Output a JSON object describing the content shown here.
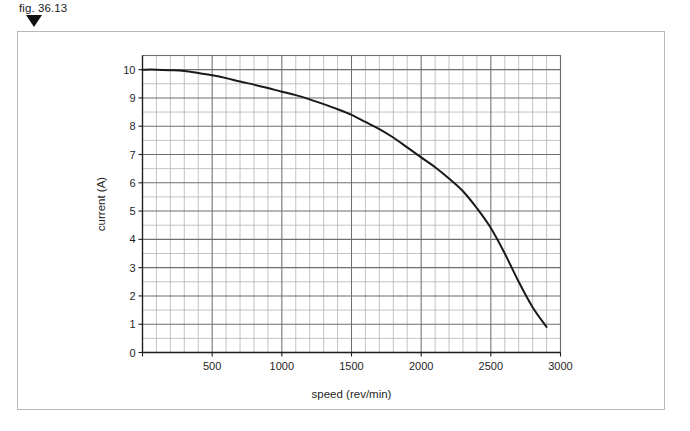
{
  "figure": {
    "label": "fig. 36.13",
    "marker_icon": "triangle-down-icon"
  },
  "chart_data": {
    "type": "line",
    "title": "",
    "subtitle": "",
    "xlabel": "speed (rev/min)",
    "ylabel": "current (A)",
    "xlim": [
      0,
      3000
    ],
    "ylim": [
      0,
      10.5
    ],
    "xticks": [
      0,
      500,
      1000,
      1500,
      2000,
      2500,
      3000
    ],
    "xtick_labels": [
      "",
      "500",
      "1000",
      "1500",
      "2000",
      "2500",
      "3000"
    ],
    "yticks": [
      0,
      1,
      2,
      3,
      4,
      5,
      6,
      7,
      8,
      9,
      10
    ],
    "ytick_labels": [
      "0",
      "1",
      "2",
      "3",
      "4",
      "5",
      "6",
      "7",
      "8",
      "9",
      "10"
    ],
    "grid": true,
    "grid_minor_x_step": 100,
    "grid_minor_y_step": 0.5,
    "grid_major_x_step": 500,
    "grid_major_y_step": 1,
    "legend": false,
    "legend_position": "none",
    "line_color": "#1a1a1a",
    "grid_color": "#6e6e74",
    "grid_minor_color": "#b0b0b6",
    "series": [
      {
        "name": "current vs speed",
        "x": [
          0,
          100,
          200,
          300,
          400,
          500,
          600,
          700,
          800,
          900,
          1000,
          1100,
          1200,
          1300,
          1400,
          1500,
          1600,
          1700,
          1800,
          1900,
          2000,
          2100,
          2200,
          2300,
          2400,
          2500,
          2600,
          2700,
          2800,
          2900
        ],
        "y": [
          10.0,
          10.0,
          9.98,
          9.95,
          9.88,
          9.8,
          9.7,
          9.58,
          9.47,
          9.35,
          9.22,
          9.1,
          8.95,
          8.78,
          8.6,
          8.4,
          8.15,
          7.9,
          7.6,
          7.25,
          6.9,
          6.55,
          6.15,
          5.7,
          5.1,
          4.4,
          3.5,
          2.5,
          1.6,
          0.9
        ]
      }
    ]
  }
}
